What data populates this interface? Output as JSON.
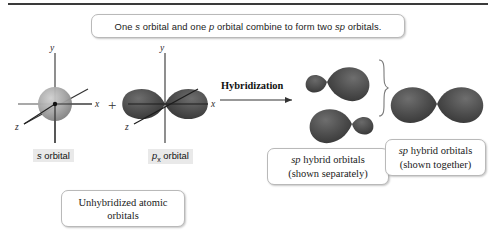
{
  "figure": {
    "title_caption": {
      "text_parts": [
        {
          "t": "One ",
          "i": false
        },
        {
          "t": "s",
          "i": true
        },
        {
          "t": " orbital and one ",
          "i": false
        },
        {
          "t": "p",
          "i": true
        },
        {
          "t": " orbital combine to form two ",
          "i": false
        },
        {
          "t": "sp",
          "i": true
        },
        {
          "t": " orbitals.",
          "i": false
        }
      ],
      "plain": "One s orbital and one p orbital combine to form two sp orbitals."
    },
    "process_label": "Hybridization",
    "plus_symbol": "+",
    "colors": {
      "background": "#ffffff",
      "rule": "#3a3a3a",
      "orbital_fill": "#4a4a4a",
      "s_orbital_fill": "#9a9a9a",
      "box_border": "#b9b9b9",
      "label_background": "#e9e9e9",
      "text": "#1a1a1a"
    }
  },
  "s_orbital": {
    "label_plain": "s orbital",
    "label_italic_part": "s",
    "label_rest": " orbital",
    "axes": {
      "x": "x",
      "y": "y",
      "z": "z"
    },
    "shape": "sphere"
  },
  "p_orbital": {
    "label_italic_part": "p",
    "label_subscript": "x",
    "label_rest": " orbital",
    "label_plain": "px orbital",
    "axes": {
      "x": "x",
      "y": "y",
      "z": "z"
    },
    "shape": "two-lobe-dumbbell"
  },
  "sp_separate": {
    "line1_italic": "sp",
    "line1_rest": " hybrid orbitals",
    "line2": "(shown separately)",
    "plain": "sp hybrid orbitals (shown separately)",
    "count": 2
  },
  "sp_together": {
    "line1_italic": "sp",
    "line1_rest": " hybrid orbitals",
    "line2": "(shown together)",
    "plain": "sp hybrid orbitals (shown together)"
  },
  "unhybridized": {
    "line1": "Unhybridized atomic",
    "line2": "orbitals",
    "plain": "Unhybridized atomic orbitals"
  }
}
